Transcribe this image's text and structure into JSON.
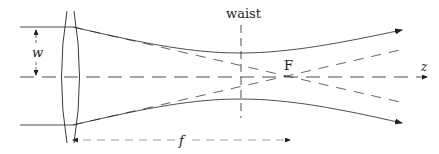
{
  "diagram": {
    "type": "gaussian-beam-focusing",
    "labels": {
      "waist": "waist",
      "focus": "F",
      "axis": "z",
      "beam_radius": "w",
      "focal_length": "f"
    },
    "colors": {
      "stroke": "#222222",
      "dashed_gray": "#888888"
    }
  }
}
